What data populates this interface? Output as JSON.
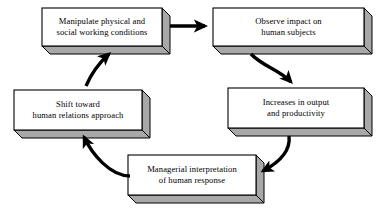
{
  "diagram": {
    "type": "cycle-flow-diagram",
    "background_color": "#ffffff",
    "box_face_color": "#ffffff",
    "box_side_color": "#a8a8a8",
    "box_top_color": "#d8d8d8",
    "box_border_color": "#000000",
    "arrow_color": "#000000"
  },
  "nodes": [
    {
      "id": "manipulate-conditions",
      "label": "Manipulate physical and\nsocial working conditions",
      "x": 42,
      "y": 8,
      "w": 120,
      "h": 38,
      "depth": 8
    },
    {
      "id": "observe-impact",
      "label": "Observe impact on\nhuman subjects",
      "x": 213,
      "y": 8,
      "w": 151,
      "h": 38,
      "depth": 8
    },
    {
      "id": "increases-output",
      "label": "Increases in output\nand productivity",
      "x": 228,
      "y": 88,
      "w": 136,
      "h": 40,
      "depth": 8
    },
    {
      "id": "managerial-interpretation",
      "label": "Managerial interpretation\nof human response",
      "x": 128,
      "y": 155,
      "w": 128,
      "h": 40,
      "depth": 8
    },
    {
      "id": "shift-human-relations",
      "label": "Shift toward\nhuman relations approach",
      "x": 14,
      "y": 90,
      "w": 128,
      "h": 40,
      "depth": 8
    }
  ],
  "arrows": [
    {
      "id": "arrow-manipulate-to-observe",
      "from": "manipulate-conditions",
      "to": "observe-impact",
      "shape": "straight",
      "path": "M 170 26 L 205 26",
      "width": 3.6
    },
    {
      "id": "arrow-observe-to-increases",
      "from": "observe-impact",
      "to": "increases-output",
      "shape": "curved",
      "path": "M 251 54 C 262 66, 280 70, 291 82",
      "width": 3.4
    },
    {
      "id": "arrow-increases-to-managerial",
      "from": "increases-output",
      "to": "managerial-interpretation",
      "shape": "curved",
      "path": "M 289 136 C 291 152, 278 163, 263 171",
      "width": 3.4
    },
    {
      "id": "arrow-managerial-to-shift",
      "from": "managerial-interpretation",
      "to": "shift-human-relations",
      "shape": "curved",
      "path": "M 130 176 C 110 176, 92 154, 84 137",
      "width": 3.4
    },
    {
      "id": "arrow-shift-to-manipulate",
      "from": "shift-human-relations",
      "to": "manipulate-conditions",
      "shape": "curved",
      "path": "M 86 86 C 92 72, 100 62, 109 54",
      "width": 3.4
    }
  ]
}
